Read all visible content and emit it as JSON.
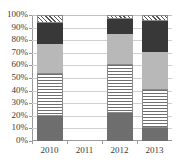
{
  "title_sliver": "",
  "chart_data": {
    "type": "bar",
    "subtype": "100% stacked column",
    "title": "",
    "xlabel": "",
    "ylabel": "",
    "categories": [
      "2010",
      "2011",
      "2012",
      "2013"
    ],
    "ylim": [
      0,
      100
    ],
    "ytick_labels": [
      "0%",
      "10%",
      "20%",
      "30%",
      "40%",
      "50%",
      "60%",
      "70%",
      "80%",
      "90%",
      "100%"
    ],
    "ytick_values": [
      0,
      10,
      20,
      30,
      40,
      50,
      60,
      70,
      80,
      90,
      100
    ],
    "grid": true,
    "legend": false,
    "legend_position": "none",
    "note": "No column is drawn for 2011 (no data).",
    "series": [
      {
        "name": "Series 1",
        "pattern": "solid-dark-gray",
        "color": "#6e6e6e",
        "values": [
          20,
          0,
          22,
          10
        ]
      },
      {
        "name": "Series 2",
        "pattern": "horizontal-stripes",
        "color": "#6f6f6f",
        "values": [
          34,
          0,
          39,
          31
        ]
      },
      {
        "name": "Series 3",
        "pattern": "solid-light-gray",
        "color": "#b8b8b8",
        "values": [
          23,
          0,
          24,
          30
        ]
      },
      {
        "name": "Series 4",
        "pattern": "solid-very-dark-gray",
        "color": "#383838",
        "values": [
          17,
          0,
          12,
          24
        ]
      },
      {
        "name": "Series 5",
        "pattern": "diagonal-crosshatch",
        "color": "#555555",
        "values": [
          6,
          0,
          3,
          5
        ]
      }
    ],
    "cumulative_boundaries": {
      "2010": [
        20,
        54,
        77,
        94,
        100
      ],
      "2011": [],
      "2012": [
        22,
        61,
        85,
        97,
        100
      ],
      "2013": [
        10,
        41,
        71,
        95,
        100
      ]
    }
  }
}
